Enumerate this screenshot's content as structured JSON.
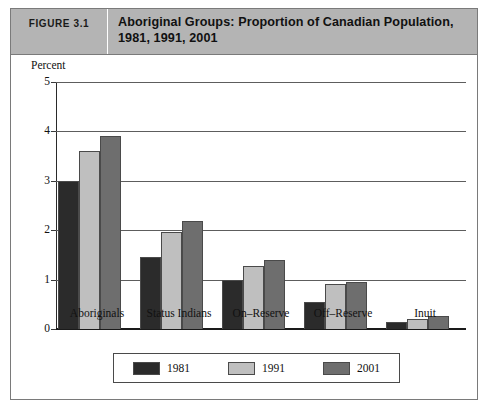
{
  "figure": {
    "number_label": "FIGURE 3.1",
    "title": "Aboriginal Groups: Proportion of Canadian Population, 1981, 1991, 2001"
  },
  "chart_data": {
    "type": "bar",
    "title": "Aboriginal Groups: Proportion of Canadian Population, 1981, 1991, 2001",
    "xlabel": "",
    "ylabel": "Percent",
    "ylim": [
      0,
      5
    ],
    "yticks": [
      "0",
      "1",
      "2",
      "3",
      "4",
      "5"
    ],
    "grid": true,
    "legend_position": "bottom",
    "categories": [
      "Aboriginals",
      "Status Indians",
      "On–Reserve",
      "Off–Reserve",
      "Inuit"
    ],
    "series": [
      {
        "name": "1981",
        "color": "#2b2b2b",
        "values": [
          3.0,
          1.45,
          1.0,
          0.55,
          0.15
        ]
      },
      {
        "name": "1991",
        "color": "#bfbfbf",
        "values": [
          3.6,
          1.97,
          1.28,
          0.92,
          0.2
        ]
      },
      {
        "name": "2001",
        "color": "#6e6e6e",
        "values": [
          3.9,
          2.18,
          1.4,
          0.95,
          0.27
        ]
      }
    ]
  },
  "colors": {
    "header_background": "#b4b4b4",
    "frame_border": "#7a7a7a",
    "gridline": "#5d5d5d"
  }
}
